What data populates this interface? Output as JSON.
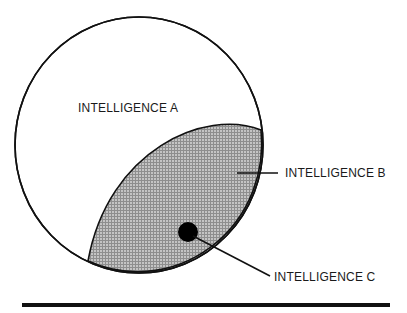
{
  "diagram": {
    "type": "nested-set diagram",
    "regions": [
      {
        "id": "A",
        "label": "INTELLIGENCE A",
        "description": "large outer circle",
        "fill": "#ffffff"
      },
      {
        "id": "B",
        "label": "INTELLIGENCE B",
        "description": "shaded crosshatched region inside A, along lower-right edge",
        "fill": "#b4b4b4"
      },
      {
        "id": "C",
        "label": "INTELLIGENCE C",
        "description": "small black dot inside B",
        "fill": "#000000"
      }
    ],
    "colors": {
      "stroke": "#111111",
      "shade": "#b4b4b4",
      "shade_dark": "#8c8c8c",
      "dot": "#000000",
      "background": "#ffffff"
    }
  }
}
